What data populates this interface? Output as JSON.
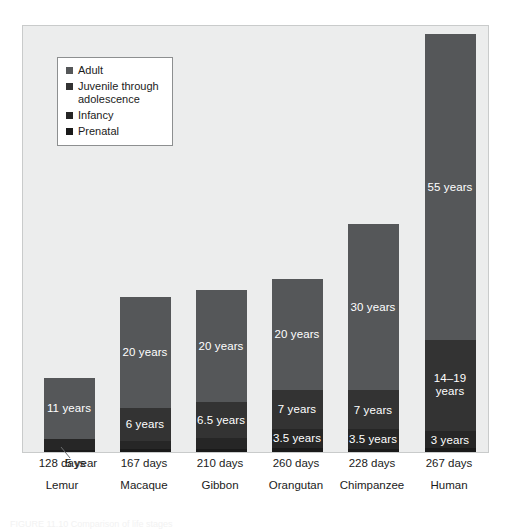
{
  "chart_data": {
    "type": "bar",
    "subtype": "stacked-bar",
    "title": "",
    "xlabel": "",
    "ylabel": "",
    "grid": false,
    "legend_position": "top-left",
    "categories": [
      "Lemur",
      "Macaque",
      "Gibbon",
      "Orangutan",
      "Chimpanzee",
      "Human"
    ],
    "series": [
      {
        "name": "Prenatal",
        "color": "#1a1a1a",
        "values": [
          0.35,
          0.46,
          0.58,
          0.71,
          0.62,
          0.73
        ],
        "labels": [
          "128 days",
          "167 days",
          "210 days",
          "260 days",
          "228 days",
          "267 days"
        ]
      },
      {
        "name": "Infancy",
        "color": "#262626",
        "values": [
          2,
          1.5,
          2,
          3.5,
          3.5,
          3
        ],
        "labels": [
          "2 years",
          "1.5 years",
          "2 years",
          "3.5 years",
          "3.5 years",
          "3 years"
        ]
      },
      {
        "name": "Juvenile through adolescence",
        "color": "#333333",
        "values": [
          0,
          6,
          6.5,
          7,
          7,
          16.5
        ],
        "labels": [
          "",
          "6 years",
          "6.5 years",
          "7 years",
          "7 years",
          "14–19\nyears"
        ]
      },
      {
        "name": "Adult",
        "color": "#555759",
        "values": [
          11,
          20,
          20,
          20,
          30,
          55
        ],
        "labels": [
          "11 years",
          "20 years",
          "20 years",
          "20 years",
          "30 years",
          "55 years"
        ]
      }
    ],
    "totals": [
      13.35,
      27.96,
      29.08,
      31.21,
      41.12,
      75.23
    ],
    "y_units": "years",
    "annotations": [
      {
        "text": ".5 year",
        "target": "Lemur prenatal segment",
        "type": "leader-line"
      }
    ]
  },
  "legend": {
    "items": [
      {
        "label": "Adult",
        "color": "#555759"
      },
      {
        "label": "Juvenile through\nadolescence",
        "color": "#333333"
      },
      {
        "label": "Infancy",
        "color": "#262626"
      },
      {
        "label": "Prenatal",
        "color": "#1a1a1a"
      }
    ]
  },
  "axis": {
    "columns": [
      {
        "gestation": "128 days",
        "species": "Lemur"
      },
      {
        "gestation": "167 days",
        "species": "Macaque"
      },
      {
        "gestation": "210 days",
        "species": "Gibbon"
      },
      {
        "gestation": "260 days",
        "species": "Orangutan"
      },
      {
        "gestation": "228 days",
        "species": "Chimpanzee"
      },
      {
        "gestation": "267 days",
        "species": "Human"
      }
    ],
    "lemur_callout": ".5 year"
  },
  "caption": "FIGURE 11.10  Comparison of life stages",
  "colors": {
    "plot_background": "#eceded",
    "plot_border": "#c9cbcb",
    "adult": "#555759",
    "juvenile": "#333333",
    "infancy": "#262626",
    "prenatal": "#1a1a1a",
    "label_text": "#ffffff",
    "axis_text": "#1b1b1b"
  }
}
